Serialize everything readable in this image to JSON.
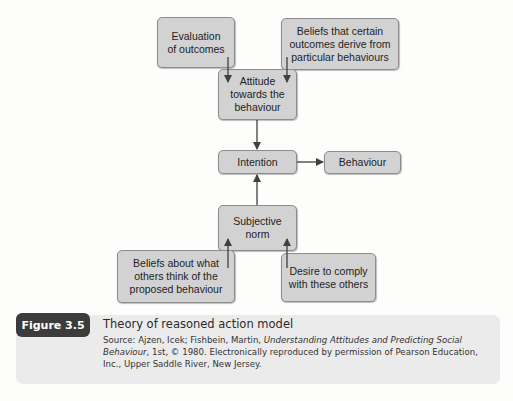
{
  "diagram": {
    "title": "Theory of reasoned action model",
    "nodes": {
      "evaluation": "Evaluation\nof outcomes",
      "beliefs_outcomes": "Beliefs that certain\noutcomes derive from\nparticular behaviours",
      "attitude": "Attitude\ntowards the\nbehaviour",
      "intention": "Intention",
      "behaviour": "Behaviour",
      "subjective_norm": "Subjective\nnorm",
      "beliefs_others": "Beliefs about what\nothers think of the\nproposed behaviour",
      "desire": "Desire to comply\nwith these others"
    },
    "edges": [
      {
        "from": "evaluation",
        "to": "attitude"
      },
      {
        "from": "beliefs_outcomes",
        "to": "attitude"
      },
      {
        "from": "attitude",
        "to": "intention"
      },
      {
        "from": "intention",
        "to": "behaviour"
      },
      {
        "from": "subjective_norm",
        "to": "intention"
      },
      {
        "from": "beliefs_others",
        "to": "subjective_norm"
      },
      {
        "from": "desire",
        "to": "subjective_norm"
      }
    ]
  },
  "caption": {
    "figure_label": "Figure 3.5",
    "title": "Theory of reasoned action model",
    "source_prefix": "Source: Ajzen, Icek; Fishbein, Martin, ",
    "source_book": "Understanding Attitudes and Predicting Social Behaviour",
    "source_suffix": ", 1st, © 1980. Electronically reproduced by permission of Pearson Education, Inc., Upper Saddle River, New Jersey."
  },
  "colors": {
    "box_fill": "#d2d2d2",
    "box_border": "#8c8c8c",
    "arrow": "#404040",
    "caption_bg": "#ebebeb",
    "badge_bg": "#3c3c3c"
  }
}
